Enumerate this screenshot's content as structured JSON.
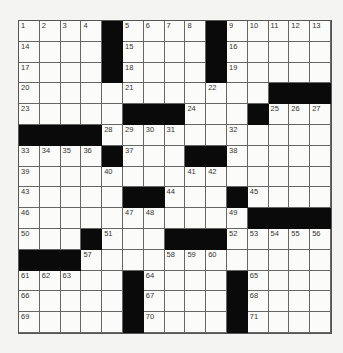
{
  "puzzle": {
    "rows": 15,
    "cols": 15,
    "grid": [
      [
        "1",
        "2",
        "3",
        "4",
        "#",
        "5",
        "6",
        "7",
        "8",
        "#",
        "9",
        "10",
        "11",
        "12",
        "13"
      ],
      [
        "14",
        "",
        "",
        "",
        "#",
        "15",
        "",
        "",
        "",
        "#",
        "16",
        "",
        "",
        "",
        ""
      ],
      [
        "17",
        "",
        "",
        "",
        "#",
        "18",
        "",
        "",
        "",
        "#",
        "19",
        "",
        "",
        "",
        ""
      ],
      [
        "20",
        "",
        "",
        "",
        "",
        "21",
        "",
        "",
        "",
        "22",
        "",
        "",
        "#",
        "#",
        "#"
      ],
      [
        "23",
        "",
        "",
        "",
        "",
        "#",
        "#",
        "#",
        "24",
        "",
        "",
        "#",
        "25",
        "26",
        "27"
      ],
      [
        "#",
        "#",
        "#",
        "#",
        "28",
        "29",
        "30",
        "31",
        "",
        "",
        "32",
        "",
        "",
        "",
        ""
      ],
      [
        "33",
        "34",
        "35",
        "36",
        "#",
        "37",
        "",
        "",
        "#",
        "#",
        "38",
        "",
        "",
        "",
        ""
      ],
      [
        "39",
        "",
        "",
        "",
        "40",
        "",
        "",
        "",
        "41",
        "42",
        "",
        "",
        "",
        "",
        ""
      ],
      [
        "43",
        "",
        "",
        "",
        "",
        "#",
        "#",
        "44",
        "",
        "",
        "#",
        "45",
        "",
        "",
        ""
      ],
      [
        "46",
        "",
        "",
        "",
        "",
        "47",
        "48",
        "",
        "",
        "",
        "49",
        "#",
        "#",
        "#",
        "#"
      ],
      [
        "50",
        "",
        "",
        "#",
        "51",
        "",
        "",
        "#",
        "#",
        "#",
        "52",
        "53",
        "54",
        "55",
        "56"
      ],
      [
        "#",
        "#",
        "#",
        "57",
        "",
        "",
        "",
        "58",
        "59",
        "60",
        "",
        "",
        "",
        "",
        ""
      ],
      [
        "61",
        "62",
        "63",
        "",
        "",
        "#",
        "64",
        "",
        "",
        "",
        "#",
        "65",
        "",
        "",
        ""
      ],
      [
        "66",
        "",
        "",
        "",
        "",
        "#",
        "67",
        "",
        "",
        "",
        "#",
        "68",
        "",
        "",
        ""
      ],
      [
        "69",
        "",
        "",
        "",
        "",
        "#",
        "70",
        "",
        "",
        "",
        "#",
        "71",
        "",
        "",
        ""
      ]
    ]
  }
}
